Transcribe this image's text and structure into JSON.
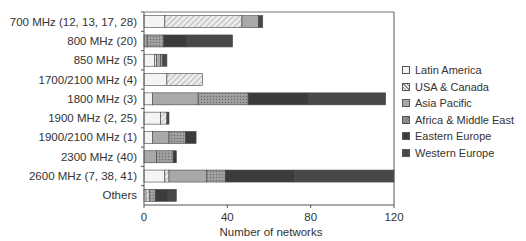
{
  "chart_data": {
    "type": "bar",
    "orientation": "horizontal",
    "stacked": true,
    "title": "",
    "xlabel": "Number of networks",
    "ylabel": "",
    "xlim": [
      0,
      120
    ],
    "xticks": [
      0,
      40,
      80,
      120
    ],
    "grid": false,
    "legend_position": "right",
    "categories": [
      "700 MHz (12, 13, 17, 28)",
      "800 MHz (20)",
      "850 MHz (5)",
      "1700/2100 MHz (4)",
      "1800 MHz (3)",
      "1900 MHz (2, 25)",
      "1900/2100 MHz (1)",
      "2300 MHz (40)",
      "2600 MHz (7, 38, 41)",
      "Others"
    ],
    "series": [
      {
        "name": "Latin America",
        "values": [
          10,
          0,
          5,
          11,
          4,
          8,
          4,
          0,
          10,
          1
        ]
      },
      {
        "name": "USA & Canada",
        "values": [
          37,
          0,
          1,
          17,
          0,
          3,
          0,
          0,
          2,
          1.5
        ]
      },
      {
        "name": "Asia Pacific",
        "values": [
          8,
          1.5,
          2,
          0,
          22,
          0,
          8,
          6,
          18,
          0
        ]
      },
      {
        "name": "Africa & Middle East",
        "values": [
          0,
          8,
          1,
          0,
          24,
          0,
          8,
          8,
          9,
          3
        ]
      },
      {
        "name": "Eastern Europe",
        "values": [
          0,
          11,
          0,
          0,
          29,
          0,
          5,
          1.5,
          33,
          6
        ]
      },
      {
        "name": "Western Europe",
        "values": [
          2,
          22,
          2,
          0,
          37,
          1,
          0,
          0,
          50,
          4
        ]
      }
    ]
  },
  "legend": [
    {
      "label": "Latin America",
      "fill": "#f4f4f4",
      "pattern": "none"
    },
    {
      "label": "USA & Canada",
      "fill": "#e2e2e2",
      "pattern": "hatch"
    },
    {
      "label": "Asia Pacific",
      "fill": "#a9a9a9",
      "pattern": "none"
    },
    {
      "label": "Africa & Middle East",
      "fill": "#8e8e8e",
      "pattern": "dots"
    },
    {
      "label": "Eastern Europe",
      "fill": "#3b3b3b",
      "pattern": "none"
    },
    {
      "label": "Western Europe",
      "fill": "#484848",
      "pattern": "none"
    }
  ]
}
